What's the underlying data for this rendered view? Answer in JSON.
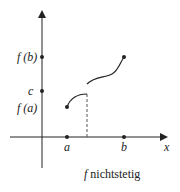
{
  "diagram": {
    "labels": {
      "fb": "f (b)",
      "c": "c",
      "fa": "f (a)",
      "a": "a",
      "b": "b",
      "x": "x"
    },
    "caption": {
      "f": "f",
      "text": "nichtstetig"
    },
    "colors": {
      "stroke": "#222222",
      "dashed": "#555555"
    }
  }
}
